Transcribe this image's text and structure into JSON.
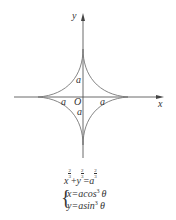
{
  "diagram": {
    "axes": {
      "x_label": "x",
      "y_label": "y",
      "origin_label": "O"
    },
    "intercept_labels": {
      "top": "a",
      "bottom": "a",
      "left": "a",
      "right": "a"
    },
    "colors": {
      "curve": "#777777",
      "axis": "#444444",
      "text": "#333333"
    }
  },
  "equations": {
    "cartesian": {
      "x": "x",
      "plus": "+",
      "y": "y",
      "eq": "=",
      "a": "a",
      "exp_num": "2",
      "exp_den": "3"
    },
    "parametric": {
      "line1": "x=acos",
      "line1_exp": "3",
      "line1_var": "θ",
      "line2": "y=asin",
      "line2_exp": "3",
      "line2_var": "θ",
      "brace": "{"
    }
  }
}
